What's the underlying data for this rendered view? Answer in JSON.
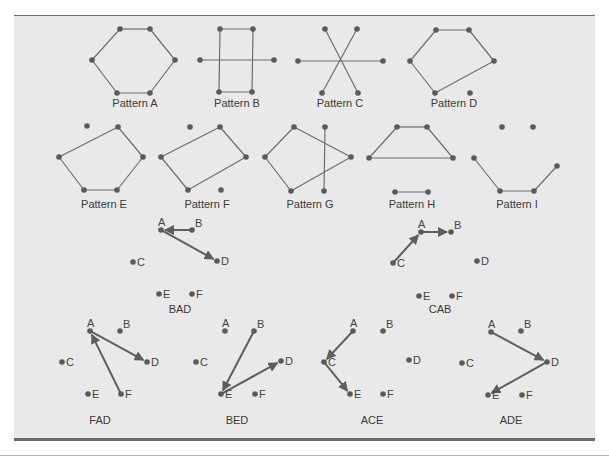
{
  "figure": {
    "patterns": [
      {
        "label": "Pattern A",
        "x": 135,
        "y": 107,
        "points": [
          [
            120,
            29
          ],
          [
            150,
            29
          ],
          [
            92,
            60
          ],
          [
            175,
            60
          ],
          [
            117,
            93
          ],
          [
            150,
            93
          ]
        ],
        "edges": [
          [
            0,
            1
          ],
          [
            1,
            3
          ],
          [
            3,
            5
          ],
          [
            5,
            4
          ],
          [
            4,
            2
          ],
          [
            2,
            0
          ]
        ]
      },
      {
        "label": "Pattern B",
        "x": 237,
        "y": 107,
        "points": [
          [
            220,
            29
          ],
          [
            253,
            29
          ],
          [
            200,
            60
          ],
          [
            274,
            60
          ],
          [
            219,
            92
          ],
          [
            252,
            92
          ]
        ],
        "edges": [
          [
            0,
            1
          ],
          [
            0,
            4
          ],
          [
            1,
            5
          ],
          [
            4,
            5
          ],
          [
            2,
            3
          ]
        ]
      },
      {
        "label": "Pattern C",
        "x": 340,
        "y": 107,
        "points": [
          [
            325,
            29
          ],
          [
            357,
            29
          ],
          [
            298,
            61
          ],
          [
            383,
            61
          ],
          [
            322,
            93
          ],
          [
            358,
            93
          ]
        ],
        "edges": [
          [
            0,
            5
          ],
          [
            1,
            4
          ],
          [
            2,
            3
          ]
        ]
      },
      {
        "label": "Pattern D",
        "x": 454,
        "y": 107,
        "points": [
          [
            436,
            30
          ],
          [
            469,
            30
          ],
          [
            410,
            61
          ],
          [
            494,
            61
          ],
          [
            435,
            93
          ],
          [
            470,
            93
          ]
        ],
        "edges": [
          [
            0,
            1
          ],
          [
            1,
            3
          ],
          [
            3,
            4
          ],
          [
            4,
            2
          ],
          [
            2,
            0
          ]
        ]
      },
      {
        "label": "Pattern E",
        "x": 104,
        "y": 208,
        "points": [
          [
            87,
            126
          ],
          [
            118,
            127
          ],
          [
            59,
            157
          ],
          [
            143,
            157
          ],
          [
            84,
            190
          ],
          [
            117,
            190
          ]
        ],
        "edges": [
          [
            1,
            3
          ],
          [
            3,
            5
          ],
          [
            5,
            4
          ],
          [
            4,
            2
          ],
          [
            2,
            1
          ]
        ]
      },
      {
        "label": "Pattern F",
        "x": 207,
        "y": 208,
        "points": [
          [
            190,
            127
          ],
          [
            220,
            127
          ],
          [
            161,
            157
          ],
          [
            246,
            157
          ],
          [
            188,
            190
          ],
          [
            221,
            190
          ]
        ],
        "edges": [
          [
            1,
            3
          ],
          [
            3,
            4
          ],
          [
            4,
            2
          ],
          [
            2,
            1
          ]
        ]
      },
      {
        "label": "Pattern G",
        "x": 310,
        "y": 208,
        "points": [
          [
            294,
            127
          ],
          [
            325,
            127
          ],
          [
            265,
            157
          ],
          [
            351,
            157
          ],
          [
            291,
            191
          ],
          [
            324,
            191
          ]
        ],
        "edges": [
          [
            0,
            3
          ],
          [
            3,
            4
          ],
          [
            4,
            2
          ],
          [
            2,
            0
          ],
          [
            1,
            5
          ]
        ]
      },
      {
        "label": "Pattern H",
        "x": 412,
        "y": 208,
        "points": [
          [
            397,
            127
          ],
          [
            427,
            127
          ],
          [
            369,
            158
          ],
          [
            453,
            158
          ],
          [
            395,
            192
          ],
          [
            428,
            192
          ]
        ],
        "edges": [
          [
            0,
            1
          ],
          [
            1,
            3
          ],
          [
            3,
            2
          ],
          [
            2,
            0
          ],
          [
            4,
            5
          ]
        ]
      },
      {
        "label": "Pattern I",
        "x": 517,
        "y": 208,
        "points": [
          [
            502,
            127
          ],
          [
            533,
            127
          ],
          [
            474,
            158
          ],
          [
            557,
            166
          ],
          [
            500,
            191
          ],
          [
            534,
            191
          ]
        ],
        "edges": [
          [
            2,
            4
          ],
          [
            4,
            5
          ],
          [
            5,
            3
          ]
        ]
      }
    ],
    "tours": [
      {
        "label": "BAD",
        "x": 180,
        "y": 313,
        "points": {
          "A": [
            161,
            230
          ],
          "B": [
            192,
            230
          ],
          "C": [
            133,
            262
          ],
          "D": [
            217,
            261
          ],
          "E": [
            159,
            294
          ],
          "F": [
            192,
            294
          ]
        },
        "arrows": [
          [
            "B",
            "A"
          ],
          [
            "A",
            "D"
          ]
        ]
      },
      {
        "label": "CAB",
        "x": 440,
        "y": 313,
        "points": {
          "A": [
            421,
            232
          ],
          "B": [
            451,
            232
          ],
          "C": [
            393,
            263
          ],
          "D": [
            477,
            261
          ],
          "E": [
            419,
            296
          ],
          "F": [
            452,
            296
          ]
        },
        "arrows": [
          [
            "C",
            "A"
          ],
          [
            "A",
            "B"
          ]
        ]
      },
      {
        "label": "FAD",
        "x": 100,
        "y": 424,
        "points": {
          "A": [
            90,
            331
          ],
          "B": [
            120,
            331
          ],
          "C": [
            62,
            362
          ],
          "D": [
            147,
            362
          ],
          "E": [
            88,
            394
          ],
          "F": [
            121,
            394
          ]
        },
        "arrows": [
          [
            "F",
            "A"
          ],
          [
            "A",
            "D"
          ]
        ]
      },
      {
        "label": "BED",
        "x": 237,
        "y": 424,
        "points": {
          "A": [
            225,
            331
          ],
          "B": [
            254,
            331
          ],
          "C": [
            196,
            362
          ],
          "D": [
            281,
            361
          ],
          "E": [
            221,
            394
          ],
          "F": [
            255,
            394
          ]
        },
        "arrows": [
          [
            "B",
            "E"
          ],
          [
            "E",
            "D"
          ]
        ]
      },
      {
        "label": "ACE",
        "x": 372,
        "y": 424,
        "points": {
          "A": [
            353,
            331
          ],
          "B": [
            383,
            331
          ],
          "C": [
            324,
            362
          ],
          "D": [
            409,
            360
          ],
          "E": [
            350,
            394
          ],
          "F": [
            383,
            394
          ]
        },
        "arrows": [
          [
            "A",
            "C"
          ],
          [
            "C",
            "E"
          ]
        ]
      },
      {
        "label": "ADE",
        "x": 511,
        "y": 424,
        "points": {
          "A": [
            491,
            332
          ],
          "B": [
            521,
            331
          ],
          "C": [
            462,
            363
          ],
          "D": [
            547,
            362
          ],
          "E": [
            488,
            395
          ],
          "F": [
            522,
            395
          ]
        },
        "arrows": [
          [
            "A",
            "D"
          ],
          [
            "D",
            "E"
          ]
        ]
      }
    ],
    "point_names": [
      "A",
      "B",
      "C",
      "D",
      "E",
      "F"
    ]
  }
}
